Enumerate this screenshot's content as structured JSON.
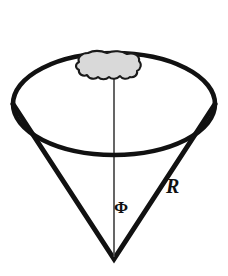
{
  "figure": {
    "background_color": "#ffffff",
    "stroke_color": "#111111",
    "blob_fill_color": "#d9d9d9",
    "blob_stroke_color": "#1a1a1a",
    "axis_color": "#4a4a4a",
    "labels": [
      {
        "id": "R",
        "text": "R",
        "style": "italic-serif",
        "x": 173,
        "y": 186
      },
      {
        "id": "Phi",
        "text": "Φ",
        "style": "upright-greek",
        "x": 120,
        "y": 208
      }
    ],
    "parts": {
      "outer_ellipse": "cone-rim-ellipse",
      "back_arc": "cone-rim-back-arc",
      "left_slant": "cone-left-slant-edge",
      "right_slant": "cone-right-slant-edge",
      "axis": "cone-central-axis",
      "patch": "surface-patch-blob",
      "apex": "cone-apex"
    },
    "geometry": {
      "apex_x": 114,
      "apex_y": 259,
      "rim_center_x": 114,
      "rim_center_y": 104,
      "rim_radius_x": 101,
      "rim_radius_y": 51,
      "axis_top_y": 77,
      "patch_left": 76,
      "patch_right": 139,
      "patch_top": 52,
      "patch_bottom": 79
    }
  }
}
